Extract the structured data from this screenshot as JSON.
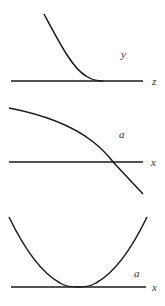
{
  "panels": [
    {
      "curve_label": "y",
      "axis_label": "z",
      "description": "monotonically decreasing curve flattening to tangent on axis"
    },
    {
      "curve_label": "a",
      "axis_label": "x",
      "description": "concave-down decreasing curve crossing the axis"
    },
    {
      "curve_label": "a",
      "axis_label": "x",
      "description": "U-shaped curve touching the axis with flat bottom"
    }
  ],
  "colors": {
    "stroke": "#1a1a1a",
    "label": "#333333",
    "background": "#ffffff"
  }
}
